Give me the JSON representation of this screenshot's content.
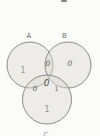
{
  "venn": {
    "set_labels": {
      "a": "A",
      "b": "B",
      "c": "C"
    },
    "regions": {
      "a_only": "1",
      "b_only": "0",
      "ab": "0",
      "abc": "0",
      "ac": "0",
      "bc": "1",
      "c_only": "1"
    },
    "colors": {
      "circle_fill": "#e7e5e1",
      "circle_stroke": "#8b8b87",
      "label_color": "#6f6f6b",
      "value_color": "#61615d",
      "background": "#fbfbf9"
    }
  }
}
